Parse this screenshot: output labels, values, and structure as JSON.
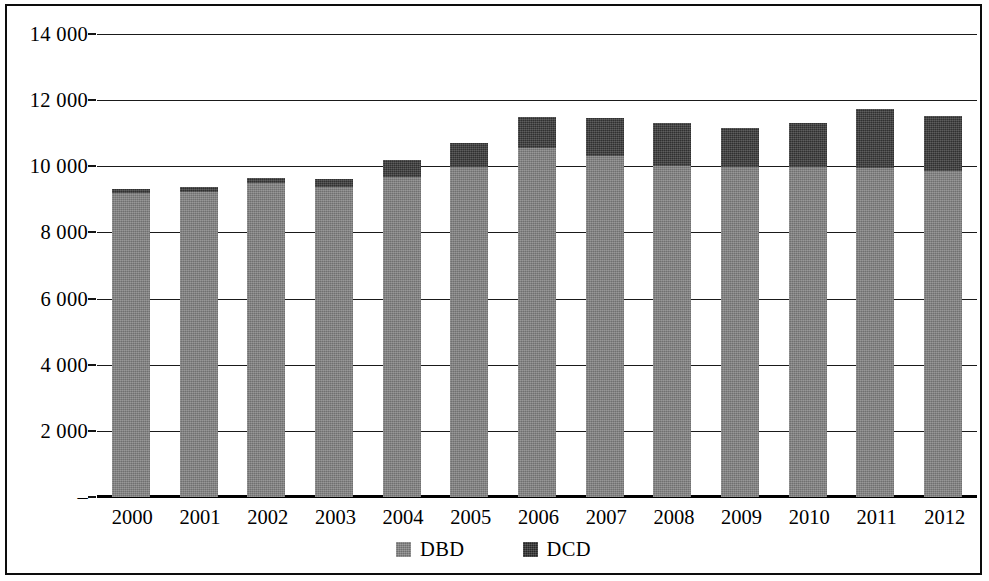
{
  "chart_data": {
    "type": "bar",
    "stacked": true,
    "title": "",
    "subtitle": "",
    "xlabel": "",
    "ylabel": "",
    "ylim": [
      0,
      14000
    ],
    "ytick_values": [
      14000,
      12000,
      10000,
      8000,
      6000,
      4000,
      2000,
      0
    ],
    "ytick_labels": [
      "14 000",
      "12 000",
      "10 000",
      "8 000",
      "6 000",
      "4 000",
      "2 000",
      "–"
    ],
    "grid": true,
    "legend_position": "bottom",
    "categories": [
      "2000",
      "2001",
      "2002",
      "2003",
      "2004",
      "2005",
      "2006",
      "2007",
      "2008",
      "2009",
      "2010",
      "2011",
      "2012"
    ],
    "series": [
      {
        "name": "DBD",
        "color": "#7d7d7d",
        "values": [
          9180,
          9230,
          9480,
          9380,
          9690,
          9970,
          10550,
          10300,
          10020,
          9970,
          9970,
          9950,
          9870
        ]
      },
      {
        "name": "DCD",
        "color": "#3a3a3a",
        "values": [
          120,
          130,
          180,
          250,
          490,
          740,
          950,
          1150,
          1280,
          1200,
          1350,
          1790,
          1660
        ]
      }
    ],
    "totals": [
      9300,
      9360,
      9660,
      9630,
      10180,
      10710,
      11500,
      11450,
      11300,
      11170,
      11320,
      11740,
      11530
    ]
  },
  "legend": {
    "items": [
      {
        "label": "DBD",
        "swatch": "dbd-swatch"
      },
      {
        "label": "DCD",
        "swatch": "dcd-swatch"
      }
    ]
  }
}
